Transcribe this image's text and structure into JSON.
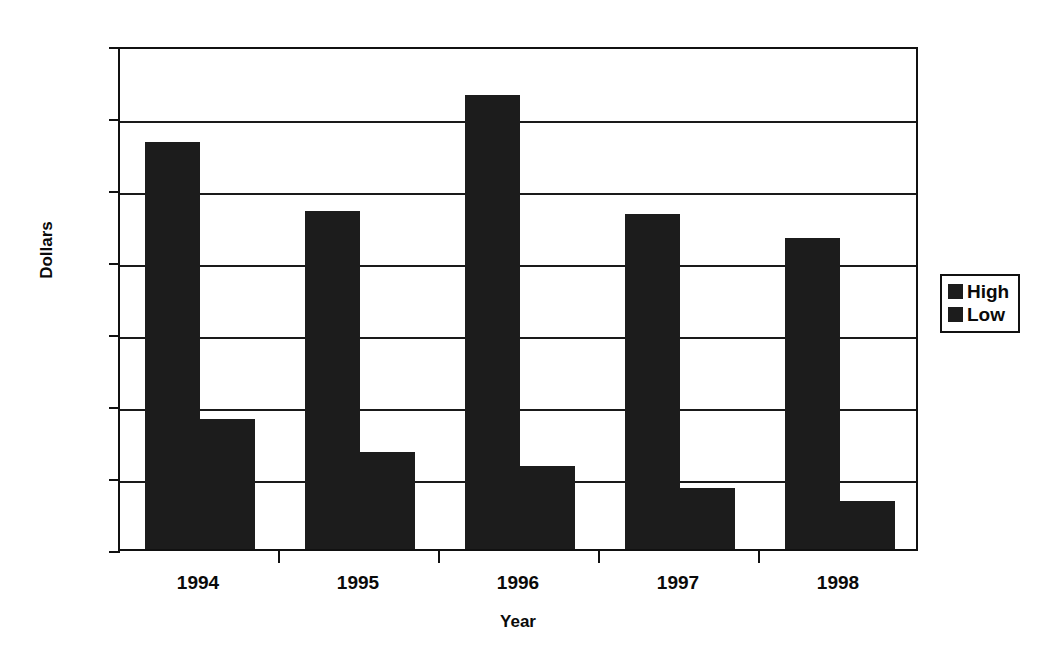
{
  "chart_data": {
    "type": "bar",
    "title": "",
    "xlabel": "Year",
    "ylabel": "Dollars",
    "categories": [
      "1994",
      "1995",
      "1996",
      "1997",
      "1998"
    ],
    "series": [
      {
        "name": "High",
        "values": [
          565,
          470,
          630,
          465,
          432
        ]
      },
      {
        "name": "Low",
        "values": [
          180,
          135,
          115,
          85,
          67
        ]
      }
    ],
    "ylim": [
      0,
      700
    ],
    "ytick_labels": [
      "0",
      "100",
      "200",
      "300",
      "400",
      "500",
      "600",
      "700"
    ],
    "ytick_values": [
      0,
      100,
      200,
      300,
      400,
      500,
      600,
      700
    ],
    "grid": "horizontal",
    "legend_position": "right",
    "bar_color": "#1c1c1c",
    "axis_color": "#111111"
  },
  "legend": {
    "entries": [
      {
        "label": "High"
      },
      {
        "label": "Low"
      }
    ]
  }
}
